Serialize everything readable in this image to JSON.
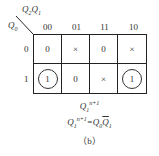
{
  "kmap": {
    "col_var": "Q2Q1",
    "row_var": "Q0",
    "col_headers": [
      "00",
      "01",
      "11",
      "10"
    ],
    "row_headers": [
      "0",
      "1"
    ],
    "cells": [
      [
        "0",
        "×",
        "0",
        "×"
      ],
      [
        "1",
        "0",
        "×",
        "1"
      ]
    ],
    "circled": [
      [
        false,
        false,
        false,
        false
      ],
      [
        true,
        false,
        false,
        true
      ]
    ]
  },
  "output_label": "Q1n+1",
  "equation": "Q1n+1 = Q0 Q̄1",
  "caption": "（b）"
}
